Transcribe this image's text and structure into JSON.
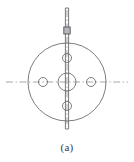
{
  "figure": {
    "caption": "(a)",
    "kind": "engineering-line-drawing",
    "colors": {
      "background": "#ffffff",
      "outline": "#6e6e72",
      "centerline": "#8d8d92",
      "shaft": "#6a6a6e",
      "collar": "#55555a",
      "caption_text": "#3a3a3a"
    },
    "canvas": {
      "width": 134,
      "height": 162,
      "drawing_height": 136
    }
  },
  "geometry": {
    "center": {
      "x": 67,
      "y": 82
    },
    "outer_circle": {
      "name": "flange-outer-circle",
      "cx": 67,
      "cy": 82,
      "r": 39,
      "stroke_width": 0.9
    },
    "center_bore": {
      "name": "center-bore",
      "cx": 67,
      "cy": 82,
      "r": 9,
      "stroke_width": 0.9
    },
    "bolt_holes": [
      {
        "label": "top-bolt-hole",
        "position": "top",
        "cx": 67,
        "cy": 58,
        "r": 4.5
      },
      {
        "label": "right-bolt-hole",
        "position": "right",
        "cx": 91,
        "cy": 82,
        "r": 4.5
      },
      {
        "label": "bottom-bolt-hole",
        "position": "bottom",
        "cx": 67,
        "cy": 106,
        "r": 4.5
      },
      {
        "label": "left-bolt-hole",
        "position": "left",
        "cx": 43,
        "cy": 82,
        "r": 4.5
      }
    ],
    "bolt_hole_count": 4,
    "bolt_circle_radius": 24,
    "shaft": {
      "name": "vertical-shaft",
      "x": 67,
      "y_top": 8,
      "y_bottom": 129,
      "half_width": 1.6
    },
    "collar": {
      "name": "shaft-collar",
      "cx": 67,
      "y_top": 27,
      "y_bottom": 34,
      "half_width": 3.2
    },
    "horizontal_centerline": {
      "name": "horizontal-centerline",
      "y": 82,
      "x_start": 6,
      "x_end": 128,
      "style": "dash-dot"
    },
    "vertical_centerline": {
      "name": "vertical-centerline",
      "x": 67,
      "y_start": 10,
      "y_end": 127,
      "style": "dash-dot"
    }
  }
}
